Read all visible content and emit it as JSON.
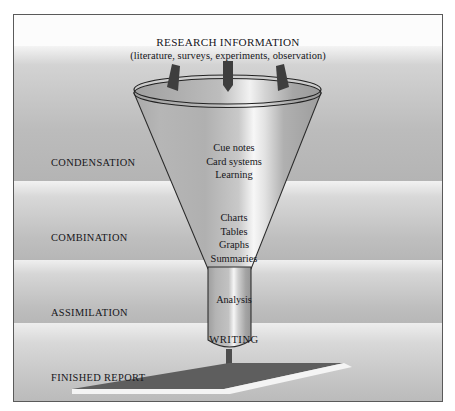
{
  "figure": {
    "width": 455,
    "height": 411,
    "type": "funnel-diagram"
  },
  "heading": {
    "title": "RESEARCH INFORMATION",
    "subtitle": "(literature, surveys, experiments, observation)"
  },
  "stages": [
    {
      "key": "condensation",
      "label": "CONDENSATION"
    },
    {
      "key": "combination",
      "label": "COMBINATION"
    },
    {
      "key": "assimilation",
      "label": "ASSIMILATION"
    },
    {
      "key": "finished",
      "label": "FINISHED REPORT"
    }
  ],
  "funnel": {
    "inputs_icon": "down-arrow-icon",
    "input_arrow_count": 3,
    "condensation_items": [
      "Cue notes",
      "Card systems",
      "Learning"
    ],
    "combination_items": [
      "Charts",
      "Tables",
      "Graphs",
      "Summaries"
    ],
    "assimilation_items": [
      "Analysis"
    ],
    "output_items": [
      "WRITING"
    ]
  },
  "colors": {
    "frame_border": "#5a5a5a",
    "band_light": "#f4f4f4",
    "band_dark": "#b4b4b4",
    "funnel_outline": "#2b2b2b",
    "funnel_highlight": "#f7f7f7",
    "funnel_shade": "#a9a9a9",
    "arrow_fill": "#3e3e3e",
    "base_fill": "#5e5e5e",
    "text": "#16161a"
  }
}
